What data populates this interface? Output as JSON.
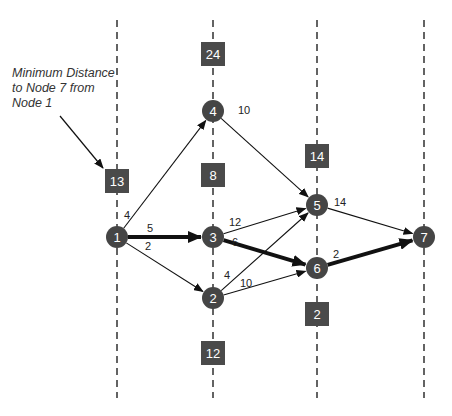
{
  "annotation": {
    "text": "Minimum Distance\nto Node 7 from\nNode 1",
    "arrow": {
      "x1": 60,
      "y1": 116,
      "x2": 103,
      "y2": 168
    }
  },
  "colors": {
    "node_fill": "#454545",
    "box_fill": "#4a4a4a",
    "label_text": "#ffffff",
    "edge": "#111111",
    "dash": "#222222",
    "weight_text": "#222222"
  },
  "stages": [
    {
      "x": 117,
      "y_top": 20,
      "y_bottom": 398
    },
    {
      "x": 213,
      "y_top": 20,
      "y_bottom": 398
    },
    {
      "x": 317,
      "y_top": 20,
      "y_bottom": 398
    },
    {
      "x": 424,
      "y_top": 20,
      "y_bottom": 398
    }
  ],
  "nodes": [
    {
      "id": "1",
      "x": 117,
      "y": 237
    },
    {
      "id": "4",
      "x": 213,
      "y": 111
    },
    {
      "id": "3",
      "x": 213,
      "y": 237
    },
    {
      "id": "2",
      "x": 213,
      "y": 298
    },
    {
      "id": "5",
      "x": 317,
      "y": 205
    },
    {
      "id": "6",
      "x": 317,
      "y": 268
    },
    {
      "id": "7",
      "x": 424,
      "y": 237
    }
  ],
  "distance_boxes": [
    {
      "value": "13",
      "x": 117,
      "y": 181
    },
    {
      "value": "24",
      "x": 213,
      "y": 54
    },
    {
      "value": "8",
      "x": 213,
      "y": 175
    },
    {
      "value": "12",
      "x": 213,
      "y": 353
    },
    {
      "value": "14",
      "x": 317,
      "y": 156
    },
    {
      "value": "2",
      "x": 317,
      "y": 314
    }
  ],
  "edges": [
    {
      "from": "1",
      "to": "4",
      "weight": "4",
      "bold": false,
      "lx": 124,
      "ly": 219
    },
    {
      "from": "1",
      "to": "3",
      "weight": "5",
      "bold": true,
      "lx": 147,
      "ly": 232
    },
    {
      "from": "1",
      "to": "2",
      "weight": "2",
      "bold": false,
      "lx": 145,
      "ly": 250
    },
    {
      "from": "4",
      "to": "5",
      "weight": "10",
      "bold": false,
      "lx": 238,
      "ly": 114
    },
    {
      "from": "3",
      "to": "5",
      "weight": "12",
      "bold": false,
      "lx": 229,
      "ly": 226
    },
    {
      "from": "3",
      "to": "6",
      "weight": "6",
      "bold": true,
      "lx": 232,
      "ly": 246
    },
    {
      "from": "2",
      "to": "5",
      "weight": "4",
      "bold": false,
      "lx": 224,
      "ly": 279
    },
    {
      "from": "2",
      "to": "6",
      "weight": "10",
      "bold": false,
      "lx": 240,
      "ly": 287
    },
    {
      "from": "5",
      "to": "7",
      "weight": "14",
      "bold": false,
      "lx": 334,
      "ly": 206
    },
    {
      "from": "6",
      "to": "7",
      "weight": "2",
      "bold": true,
      "lx": 333,
      "ly": 258
    }
  ]
}
